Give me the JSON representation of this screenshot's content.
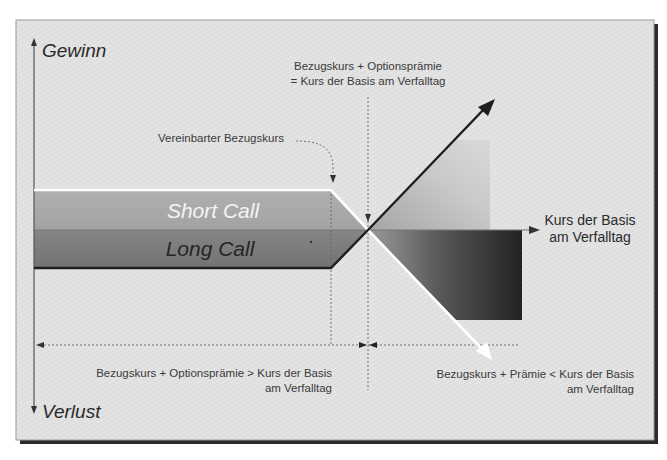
{
  "diagram": {
    "axes": {
      "y_positive_label": "Gewinn",
      "y_negative_label": "Verlust",
      "x_label_line1": "Kurs der Basis",
      "x_label_line2": "am Verfalltag"
    },
    "bands": {
      "short_call": "Short Call",
      "long_call": "Long Call"
    },
    "annotations": {
      "strike_label": "Vereinbarter Bezugskurs",
      "breakeven_line1": "Bezugskurs + Optionsprämie",
      "breakeven_line2": "= Kurs der Basis am Verfalltag",
      "left_region_line1": "Bezugskurs + Optionsprämie > Kurs der Basis",
      "left_region_line2": "am Verfalltag",
      "right_region_line1": "Bezugskurs + Prämie < Kurs der Basis",
      "right_region_line2": "am Verfalltag"
    },
    "colors": {
      "background": "#e4e4e4",
      "short_band": "#a9a9a9",
      "long_band": "#7c7c7c",
      "short_line": "#ffffff",
      "long_line": "#1e1e1e",
      "frame_shadow": "#2b2b2b"
    }
  }
}
